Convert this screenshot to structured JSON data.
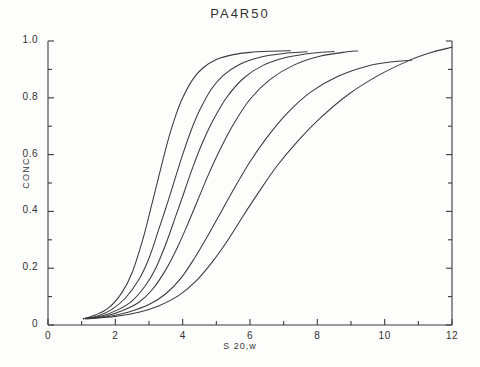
{
  "chart_data": {
    "type": "line",
    "title": "PA4R50",
    "xlabel": "S 20,w",
    "ylabel": "CONC",
    "xlim": [
      0,
      12
    ],
    "ylim": [
      0,
      1.0
    ],
    "xticks": [
      0,
      2,
      4,
      6,
      8,
      10,
      12
    ],
    "xtick_labels": [
      "0",
      "2",
      "4",
      "6",
      "8",
      "10",
      "12"
    ],
    "xminor_ticks": [
      1,
      3,
      5,
      7,
      9,
      11
    ],
    "yticks": [
      0,
      0.2,
      0.4,
      0.6,
      0.8,
      1.0
    ],
    "ytick_labels": [
      "0",
      "0.2",
      "0.4",
      "0.6",
      "0.8",
      "1.0"
    ],
    "yminor_ticks": [
      0.1,
      0.3,
      0.5,
      0.7,
      0.9
    ],
    "grid": false,
    "legend": "none",
    "line_color": "#3b3b3b",
    "background": "#fdfdfc",
    "series": [
      {
        "name": "curve-1",
        "x": [
          1.05,
          1.4,
          1.8,
          2.2,
          2.5,
          2.8,
          3.0,
          3.2,
          3.4,
          3.6,
          3.8,
          4.0,
          4.3,
          4.6,
          5.0,
          5.5,
          6.0,
          6.6,
          7.2
        ],
        "y": [
          0.022,
          0.035,
          0.06,
          0.115,
          0.185,
          0.295,
          0.385,
          0.48,
          0.575,
          0.665,
          0.74,
          0.8,
          0.865,
          0.905,
          0.935,
          0.952,
          0.96,
          0.964,
          0.966
        ]
      },
      {
        "name": "curve-2",
        "x": [
          1.05,
          1.5,
          1.9,
          2.3,
          2.7,
          3.0,
          3.3,
          3.55,
          3.8,
          4.0,
          4.25,
          4.5,
          4.85,
          5.2,
          5.7,
          6.3,
          7.0,
          7.7
        ],
        "y": [
          0.022,
          0.033,
          0.055,
          0.095,
          0.16,
          0.235,
          0.34,
          0.43,
          0.525,
          0.6,
          0.685,
          0.755,
          0.83,
          0.878,
          0.918,
          0.943,
          0.956,
          0.962
        ]
      },
      {
        "name": "curve-3",
        "x": [
          1.05,
          1.6,
          2.1,
          2.5,
          2.9,
          3.2,
          3.5,
          3.8,
          4.05,
          4.3,
          4.6,
          4.9,
          5.3,
          5.8,
          6.4,
          7.1,
          7.9,
          8.5
        ],
        "y": [
          0.022,
          0.032,
          0.055,
          0.085,
          0.14,
          0.2,
          0.285,
          0.385,
          0.47,
          0.555,
          0.645,
          0.72,
          0.8,
          0.868,
          0.915,
          0.943,
          0.958,
          0.963
        ]
      },
      {
        "name": "curve-4",
        "x": [
          1.1,
          1.7,
          2.2,
          2.7,
          3.1,
          3.5,
          3.85,
          4.15,
          4.45,
          4.75,
          5.1,
          5.5,
          6.0,
          6.6,
          7.3,
          8.1,
          8.9,
          9.2
        ],
        "y": [
          0.022,
          0.031,
          0.05,
          0.08,
          0.125,
          0.195,
          0.275,
          0.355,
          0.44,
          0.525,
          0.615,
          0.705,
          0.795,
          0.865,
          0.915,
          0.947,
          0.962,
          0.965
        ]
      },
      {
        "name": "curve-5",
        "x": [
          1.1,
          1.8,
          2.4,
          3.0,
          3.5,
          3.95,
          4.35,
          4.75,
          5.15,
          5.55,
          6.0,
          6.5,
          7.1,
          7.8,
          8.6,
          9.5,
          10.3,
          10.8
        ],
        "y": [
          0.022,
          0.03,
          0.046,
          0.072,
          0.11,
          0.165,
          0.235,
          0.315,
          0.4,
          0.485,
          0.575,
          0.66,
          0.745,
          0.82,
          0.875,
          0.912,
          0.928,
          0.932
        ]
      },
      {
        "name": "curve-6",
        "x": [
          1.15,
          2.0,
          2.7,
          3.3,
          3.9,
          4.4,
          4.9,
          5.35,
          5.8,
          6.3,
          6.8,
          7.4,
          8.1,
          8.9,
          9.8,
          10.7,
          11.4,
          12.0
        ],
        "y": [
          0.022,
          0.03,
          0.045,
          0.068,
          0.105,
          0.155,
          0.225,
          0.3,
          0.385,
          0.475,
          0.56,
          0.645,
          0.73,
          0.81,
          0.878,
          0.93,
          0.96,
          0.978
        ]
      }
    ]
  }
}
